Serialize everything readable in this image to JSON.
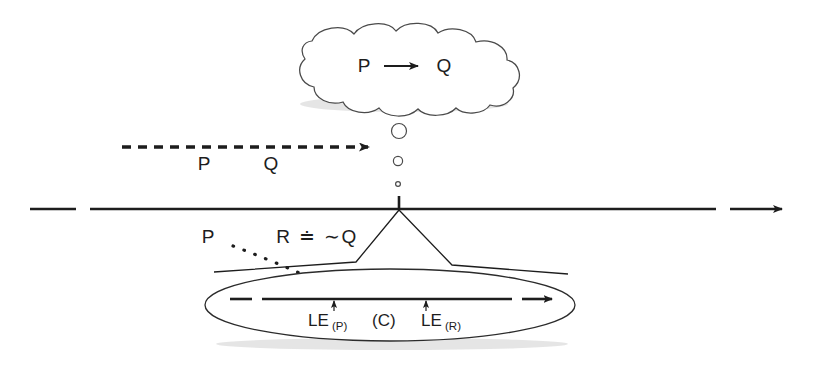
{
  "figure": {
    "background_color": "#ffffff",
    "ink_color": "#1d1d1d",
    "outline_color": "#4a4a4a"
  },
  "thought_cloud": {
    "name": "thought-cloud",
    "antecedent": "P",
    "connective": "→",
    "consequent": "Q",
    "full_text": "P → Q"
  },
  "thought_trail": {
    "name": "thought-bubble-trail",
    "bubbles": [
      {
        "label": "bubble-large",
        "r": 7.5
      },
      {
        "label": "bubble-medium",
        "r": 4.6
      },
      {
        "label": "bubble-small",
        "r": 2.4
      }
    ]
  },
  "dashed_arrow": {
    "name": "dashed-inference-arrow",
    "direction": "right",
    "labels": [
      "P",
      "Q"
    ]
  },
  "timeline": {
    "name": "main-timeline",
    "direction": "right",
    "style": "solid-with-leading-dash"
  },
  "below_line_labels": {
    "premise": "P",
    "rule": "R",
    "relation": "≐",
    "negation": "∼",
    "conclusion": "Q",
    "combined": "R ≐ ∼Q"
  },
  "ellipse_zoom": {
    "name": "zoom-ellipse",
    "inner_arrow": {
      "name": "inner-timeline-arrow",
      "direction": "right"
    },
    "markers": [
      {
        "name": "marker-le-p",
        "label": "LE",
        "subscript": "(P)"
      },
      {
        "name": "marker-c",
        "label": "(C)",
        "subscript": ""
      },
      {
        "name": "marker-le-r",
        "label": "LE",
        "subscript": "(R)"
      }
    ],
    "label_le_p": "LE",
    "label_le_p_sub": "(P)",
    "label_c": "(C)",
    "label_le_r": "LE",
    "label_le_r_sub": "(R)"
  },
  "dotted_curve": {
    "name": "dotted-trajectory-curve",
    "style": "dotted"
  }
}
